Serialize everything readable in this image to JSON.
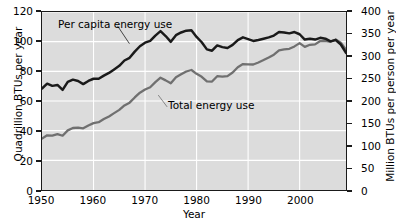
{
  "chart_data": {
    "type": "line",
    "title": "",
    "xlabel": "Year",
    "ylabel": "Quadrillion BTUs per year",
    "ylabel_right": "Million BTUs per person per year",
    "xlim": [
      1950,
      2009
    ],
    "ylim": [
      0,
      120
    ],
    "ylim_right": [
      0,
      400
    ],
    "grid": true,
    "legend": "inline-annotations",
    "xticks": [
      1950,
      1960,
      1970,
      1980,
      1990,
      2000
    ],
    "yticks_left": [
      0,
      20,
      40,
      60,
      80,
      100,
      120
    ],
    "yticks_right": [
      0,
      50,
      100,
      150,
      200,
      250,
      300,
      350,
      400
    ],
    "x": [
      1950,
      1951,
      1952,
      1953,
      1954,
      1955,
      1956,
      1957,
      1958,
      1959,
      1960,
      1961,
      1962,
      1963,
      1964,
      1965,
      1966,
      1967,
      1968,
      1969,
      1970,
      1971,
      1972,
      1973,
      1974,
      1975,
      1976,
      1977,
      1978,
      1979,
      1980,
      1981,
      1982,
      1983,
      1984,
      1985,
      1986,
      1987,
      1988,
      1989,
      1990,
      1991,
      1992,
      1993,
      1994,
      1995,
      1996,
      1997,
      1998,
      1999,
      2000,
      2001,
      2002,
      2003,
      2004,
      2005,
      2006,
      2007,
      2008,
      2009
    ],
    "series": [
      {
        "name": "Total energy use",
        "axis": "left",
        "units": "Quadrillion BTUs per year",
        "color": "#707070",
        "values": [
          34.6,
          36.9,
          36.7,
          37.7,
          36.6,
          40.2,
          41.8,
          42.0,
          41.6,
          43.5,
          45.1,
          45.7,
          47.8,
          49.6,
          51.8,
          54.0,
          57.0,
          58.9,
          62.4,
          65.6,
          67.8,
          69.3,
          72.7,
          75.7,
          73.9,
          71.9,
          76.0,
          78.0,
          79.9,
          80.9,
          78.3,
          76.3,
          73.2,
          73.1,
          76.7,
          76.5,
          76.8,
          79.2,
          82.8,
          84.9,
          84.7,
          84.6,
          86.0,
          87.6,
          89.3,
          91.2,
          94.2,
          94.8,
          95.2,
          96.8,
          99.0,
          96.5,
          97.9,
          98.2,
          100.4,
          100.5,
          99.9,
          101.5,
          99.3,
          94.6
        ]
      },
      {
        "name": "Per capita energy use",
        "axis": "right",
        "units": "Million BTUs per person per year",
        "color": "#1a1a1a",
        "values": [
          228,
          239,
          234,
          236,
          225,
          243,
          248,
          245,
          238,
          245,
          250,
          250,
          257,
          263,
          271,
          279,
          291,
          297,
          311,
          323,
          331,
          335,
          347,
          357,
          346,
          333,
          348,
          354,
          358,
          359,
          344,
          332,
          316,
          313,
          325,
          321,
          319,
          326,
          337,
          343,
          339,
          335,
          337,
          340,
          343,
          347,
          355,
          354,
          352,
          355,
          350,
          338,
          340,
          338,
          342,
          340,
          334,
          337,
          327,
          308
        ]
      }
    ],
    "annotations": [
      {
        "text": "Per capita energy use",
        "series": "Per capita energy use"
      },
      {
        "text": "Total energy use",
        "series": "Total energy use"
      }
    ]
  },
  "axes": {
    "left": {
      "title": "Quadrillion BTUs per year",
      "ticks": [
        "0",
        "20",
        "40",
        "60",
        "80",
        "100",
        "120"
      ]
    },
    "right": {
      "title": "Million BTUs per person per year",
      "ticks": [
        "0",
        "50",
        "100",
        "150",
        "200",
        "250",
        "300",
        "350",
        "400"
      ]
    },
    "bottom": {
      "title": "Year",
      "ticks": [
        "1950",
        "1960",
        "1970",
        "1980",
        "1990",
        "2000"
      ]
    }
  },
  "labels": {
    "per_capita": "Per capita energy use",
    "total": "Total energy use"
  },
  "colors": {
    "plot_background": "#dcdcdc",
    "gridline": "#ffffff",
    "frame": "#1a1a1a",
    "per_capita_line": "#1a1a1a",
    "total_line": "#707070",
    "page_background": "#ffffff"
  }
}
